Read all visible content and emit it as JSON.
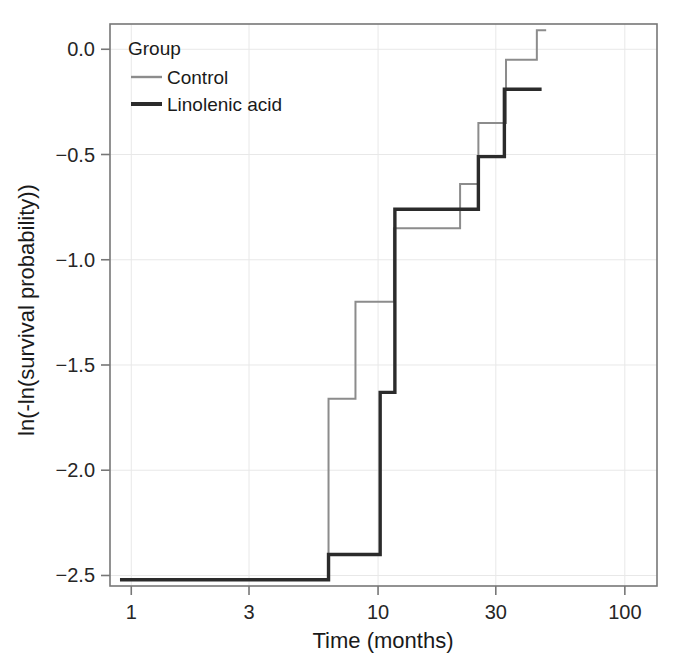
{
  "chart_data": {
    "type": "line",
    "subtype": "step",
    "title": "",
    "xlabel": "Time (months)",
    "ylabel": "ln(-ln(survival probability))",
    "xscale": "log",
    "xlim": [
      0.82,
      135
    ],
    "ylim": [
      -2.55,
      0.12
    ],
    "xticks": [
      1,
      3,
      10,
      30,
      100
    ],
    "xtick_labels": [
      "1",
      "3",
      "10",
      "30",
      "100"
    ],
    "yticks": [
      0.0,
      -0.5,
      -1.0,
      -1.5,
      -2.0,
      -2.5
    ],
    "ytick_labels": [
      "0.0",
      "−0.5",
      "−1.0",
      "−1.5",
      "−2.0",
      "−2.5"
    ],
    "grid": true,
    "grid_color": "#e8e8e8",
    "legend_title": "Group",
    "legend_position": "top-left inside",
    "series": [
      {
        "name": "Control",
        "color": "#8c8c8c",
        "linewidth": 2,
        "steps": [
          {
            "t": 0.9,
            "y": -2.52
          },
          {
            "t": 6.3,
            "y": -2.52
          },
          {
            "t": 6.3,
            "y": -1.66
          },
          {
            "t": 8.1,
            "y": -1.66
          },
          {
            "t": 8.1,
            "y": -1.2
          },
          {
            "t": 11.6,
            "y": -1.2
          },
          {
            "t": 11.6,
            "y": -0.85
          },
          {
            "t": 21.5,
            "y": -0.85
          },
          {
            "t": 21.5,
            "y": -0.64
          },
          {
            "t": 25.5,
            "y": -0.64
          },
          {
            "t": 25.5,
            "y": -0.35
          },
          {
            "t": 33.0,
            "y": -0.35
          },
          {
            "t": 33.0,
            "y": -0.05
          },
          {
            "t": 44.0,
            "y": -0.05
          },
          {
            "t": 44.0,
            "y": 0.09
          },
          {
            "t": 48.0,
            "y": 0.09
          }
        ]
      },
      {
        "name": "Linolenic acid",
        "color": "#2b2b2b",
        "linewidth": 3.4,
        "steps": [
          {
            "t": 0.9,
            "y": -2.52
          },
          {
            "t": 6.3,
            "y": -2.52
          },
          {
            "t": 6.3,
            "y": -2.4
          },
          {
            "t": 10.2,
            "y": -2.4
          },
          {
            "t": 10.2,
            "y": -1.63
          },
          {
            "t": 11.7,
            "y": -1.63
          },
          {
            "t": 11.7,
            "y": -0.76
          },
          {
            "t": 25.5,
            "y": -0.76
          },
          {
            "t": 25.5,
            "y": -0.51
          },
          {
            "t": 32.5,
            "y": -0.51
          },
          {
            "t": 32.5,
            "y": -0.19
          },
          {
            "t": 46.0,
            "y": -0.19
          }
        ]
      }
    ]
  },
  "legend": {
    "title": "Group",
    "items": [
      {
        "label": "Control",
        "color": "#8c8c8c"
      },
      {
        "label": "Linolenic acid",
        "color": "#2b2b2b"
      }
    ]
  },
  "axes": {
    "x_title": "Time (months)",
    "y_title": "ln(-ln(survival probability))",
    "x_tick_labels": [
      "1",
      "3",
      "10",
      "30",
      "100"
    ],
    "y_tick_labels": [
      "0.0",
      "−0.5",
      "−1.0",
      "−1.5",
      "−2.0",
      "−2.5"
    ]
  }
}
